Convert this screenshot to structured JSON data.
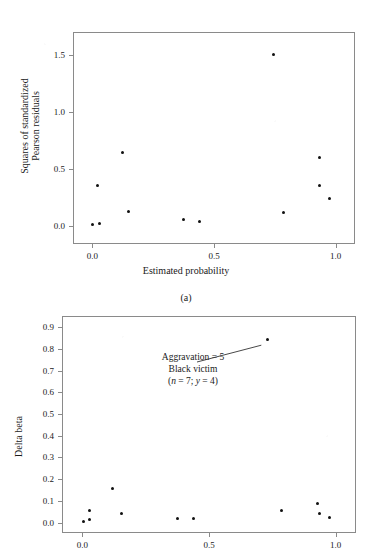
{
  "figure": {
    "background_color": "#ffffff",
    "point_color": "#111111",
    "axis_color": "#8a8a8a"
  },
  "panel_a": {
    "caption": "(a)",
    "chart_data": {
      "type": "scatter",
      "title": "",
      "xlabel": "Estimated probability",
      "ylabel": "Squares of standardized Pearson residuals",
      "ylabel_line1": "Squares of standardized",
      "ylabel_line2": "Pearson residuals",
      "xlim": [
        -0.08,
        1.08
      ],
      "ylim": [
        -0.16,
        1.7
      ],
      "xticks": [
        0.0,
        0.5,
        1.0
      ],
      "xticklabels": [
        "0.0",
        "0.5",
        "1.0"
      ],
      "yticks": [
        0.0,
        0.5,
        1.0,
        1.5
      ],
      "yticklabels": [
        "0.0",
        "0.5",
        "1.0",
        "1.5"
      ],
      "grid": false,
      "legend": "none",
      "x": [
        0.0,
        0.03,
        0.02,
        0.125,
        0.15,
        0.375,
        0.44,
        0.745,
        0.785,
        0.935,
        0.935,
        0.975
      ],
      "y": [
        0.01,
        0.02,
        0.35,
        0.64,
        0.125,
        0.055,
        0.04,
        1.5,
        0.12,
        0.6,
        0.35,
        0.235
      ],
      "points": [
        {
          "x": 0.0,
          "y": 0.01
        },
        {
          "x": 0.03,
          "y": 0.02
        },
        {
          "x": 0.02,
          "y": 0.35
        },
        {
          "x": 0.125,
          "y": 0.64
        },
        {
          "x": 0.15,
          "y": 0.125
        },
        {
          "x": 0.375,
          "y": 0.055
        },
        {
          "x": 0.44,
          "y": 0.04
        },
        {
          "x": 0.745,
          "y": 1.5
        },
        {
          "x": 0.785,
          "y": 0.12
        },
        {
          "x": 0.935,
          "y": 0.6
        },
        {
          "x": 0.935,
          "y": 0.35
        },
        {
          "x": 0.975,
          "y": 0.235
        }
      ]
    }
  },
  "panel_b": {
    "caption": "",
    "annotation": {
      "line1": "Aggravation = 5",
      "line2": "Black victim",
      "line3_prefix": "(",
      "line3_n_var": "n",
      "line3_n_val": " = 7; ",
      "line3_y_var": "y",
      "line3_y_val": " = 4)",
      "target_point": {
        "x": 0.73,
        "y": 0.845
      }
    },
    "chart_data": {
      "type": "scatter",
      "title": "",
      "xlabel": "",
      "ylabel": "Delta beta",
      "xlim": [
        -0.08,
        1.08
      ],
      "ylim": [
        -0.048,
        0.952
      ],
      "xticks": [
        0.0,
        0.5,
        1.0
      ],
      "xticklabels": [
        "0.0",
        "0.5",
        "1.0"
      ],
      "yticks": [
        0.0,
        0.1,
        0.2,
        0.3,
        0.4,
        0.5,
        0.6,
        0.7,
        0.8,
        0.9
      ],
      "yticklabels": [
        "0.0",
        "0.1",
        "0.2",
        "0.3",
        "0.4",
        "0.5",
        "0.6",
        "0.7",
        "0.8",
        "0.9"
      ],
      "grid": false,
      "legend": "none",
      "x": [
        0.005,
        0.03,
        0.03,
        0.12,
        0.155,
        0.375,
        0.44,
        0.73,
        0.785,
        0.93,
        0.935,
        0.975
      ],
      "y": [
        0.005,
        0.055,
        0.015,
        0.158,
        0.04,
        0.018,
        0.018,
        0.845,
        0.055,
        0.09,
        0.04,
        0.023
      ],
      "points": [
        {
          "x": 0.005,
          "y": 0.005
        },
        {
          "x": 0.03,
          "y": 0.055
        },
        {
          "x": 0.03,
          "y": 0.015
        },
        {
          "x": 0.12,
          "y": 0.158
        },
        {
          "x": 0.155,
          "y": 0.04
        },
        {
          "x": 0.375,
          "y": 0.018
        },
        {
          "x": 0.44,
          "y": 0.018
        },
        {
          "x": 0.73,
          "y": 0.845
        },
        {
          "x": 0.785,
          "y": 0.055
        },
        {
          "x": 0.93,
          "y": 0.09
        },
        {
          "x": 0.935,
          "y": 0.04
        },
        {
          "x": 0.975,
          "y": 0.023
        }
      ]
    }
  }
}
